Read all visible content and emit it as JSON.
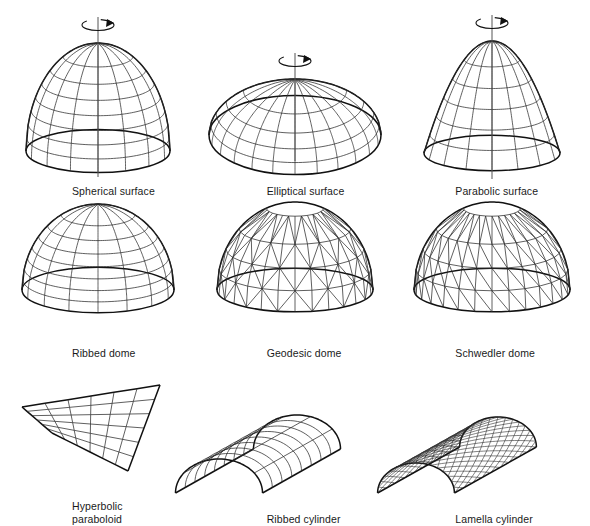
{
  "figure": {
    "background_color": "#ffffff",
    "line_color": "#111111",
    "mesh_color": "#2b2b2b",
    "axis_color": "#555555",
    "columns": 3,
    "rows": 3
  },
  "items": [
    {
      "id": "spherical-surface",
      "label": "Spherical surface",
      "kind": "dome",
      "has_rotation_axis": true,
      "geometry": {
        "cx": 98,
        "cy": 148,
        "rx": 72,
        "ry": 108,
        "squash": 0.3,
        "meridians": 8,
        "rings": 7,
        "profile": "circular",
        "ring_spacing": "equal-angle"
      }
    },
    {
      "id": "elliptical-surface",
      "label": "Elliptical surface",
      "kind": "dome",
      "has_rotation_axis": true,
      "geometry": {
        "cx": 98,
        "cy": 132,
        "rx": 86,
        "ry": 56,
        "squash": 0.46,
        "meridians": 12,
        "rings": 4,
        "profile": "elliptical",
        "ring_spacing": "equal-angle"
      }
    },
    {
      "id": "parabolic-surface",
      "label": "Parabolic surface",
      "kind": "dome",
      "has_rotation_axis": true,
      "geometry": {
        "cx": 98,
        "cy": 150,
        "rx": 68,
        "ry": 112,
        "squash": 0.26,
        "meridians": 8,
        "rings": 5,
        "profile": "parabolic",
        "ring_spacing": "equal-angle"
      }
    },
    {
      "id": "ribbed-dome",
      "label": "Ribbed dome",
      "kind": "dome",
      "has_rotation_axis": false,
      "geometry": {
        "cx": 98,
        "cy": 122,
        "rx": 76,
        "ry": 86,
        "squash": 0.3,
        "meridians": 8,
        "rings": 7,
        "profile": "circular",
        "ring_spacing": "equal-angle"
      }
    },
    {
      "id": "geodesic-dome",
      "label": "Geodesic dome",
      "kind": "faceted-dome",
      "has_rotation_axis": false,
      "geometry": {
        "cx": 98,
        "cy": 122,
        "rx": 78,
        "ry": 88,
        "squash": 0.28,
        "segments": 14,
        "rings": 4,
        "bracing": "triangulated-alternating",
        "profile": "circular"
      }
    },
    {
      "id": "schwedler-dome",
      "label": "Schwedler dome",
      "kind": "faceted-dome",
      "has_rotation_axis": false,
      "geometry": {
        "cx": 98,
        "cy": 122,
        "rx": 78,
        "ry": 88,
        "squash": 0.28,
        "segments": 14,
        "rings": 4,
        "bracing": "single-diagonal",
        "profile": "circular"
      }
    },
    {
      "id": "hyperbolic-paraboloid",
      "label": "Hyperbolic\nparaboloid",
      "kind": "hypar",
      "has_rotation_axis": false,
      "geometry": {
        "corners": [
          [
            22,
            34
          ],
          [
            160,
            22
          ],
          [
            128,
            98
          ],
          [
            52,
            70
          ]
        ],
        "divisions": 6,
        "warp": 10
      }
    },
    {
      "id": "ribbed-cylinder",
      "label": "Ribbed cylinder",
      "kind": "barrel-vault",
      "has_rotation_axis": false,
      "geometry": {
        "length": 130,
        "radius": 34,
        "depth_x": 78,
        "depth_y": -44,
        "ribs": 8,
        "longitudinals": 5,
        "mesh": "orthogonal"
      }
    },
    {
      "id": "lamella-cylinder",
      "label": "Lamella cylinder",
      "kind": "barrel-vault",
      "has_rotation_axis": false,
      "geometry": {
        "length": 130,
        "radius": 30,
        "depth_x": 82,
        "depth_y": -46,
        "ribs": 16,
        "longitudinals": 9,
        "mesh": "diagonal-lamella"
      }
    }
  ]
}
